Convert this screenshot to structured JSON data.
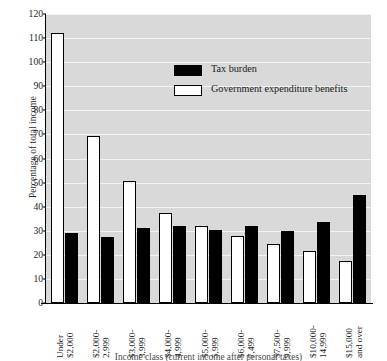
{
  "chart_data": {
    "type": "bar",
    "title": "",
    "subtitle": "",
    "xlabel": "Income class (current income after personal taxes)",
    "ylabel": "Percentage of total income",
    "ylim": [
      0,
      120
    ],
    "ytick_step": 10,
    "yticks": [
      0,
      10,
      20,
      30,
      40,
      50,
      60,
      70,
      80,
      90,
      100,
      110,
      120
    ],
    "grid": "horizontal",
    "legend_position": "inside-top-center",
    "categories": [
      "Under $2,000",
      "$2,000-2,999",
      "$3,000-3,999",
      "$4,000-4,999",
      "$5,000-5,999",
      "$6,000-7,499",
      "$7,500-9,999",
      "$10,000-14,999",
      "$15,000 and over"
    ],
    "category_lines": [
      [
        "Under",
        "$2,000"
      ],
      [
        "$2,000-",
        "2,999"
      ],
      [
        "$3,000-",
        "3,999"
      ],
      [
        "$4,000-",
        "4,999"
      ],
      [
        "$5,000-",
        "5,999"
      ],
      [
        "$6,000-",
        "7,499"
      ],
      [
        "$7,500-",
        "9,999"
      ],
      [
        "$10,000-",
        "14,999"
      ],
      [
        "$15,000",
        "and over"
      ]
    ],
    "series": [
      {
        "name": "Government expenditure benefits",
        "color": "#ffffff",
        "edge_color": "#000000",
        "values": [
          112,
          69.5,
          50.5,
          37.5,
          32,
          28,
          24.5,
          21.5,
          17.5
        ]
      },
      {
        "name": "Tax burden",
        "color": "#000000",
        "edge_color": "#000000",
        "values": [
          29,
          27.5,
          31,
          32,
          30.5,
          32,
          30,
          33.5,
          45
        ]
      }
    ]
  },
  "legend": {
    "items": [
      {
        "label": "Tax burden",
        "swatch": "black"
      },
      {
        "label": "Government expenditure benefits",
        "swatch": "white"
      }
    ]
  },
  "axes": {
    "y_title": "Percentage of total income",
    "x_title": "Income class (current income after personal taxes)"
  },
  "colors": {
    "plot_background": "#d9d9d9",
    "gridline": "#f4f4f4",
    "axis": "#000000",
    "bar_tax_burden": "#000000",
    "bar_expenditure_benefits": "#ffffff",
    "text": "#1a1a1a"
  }
}
